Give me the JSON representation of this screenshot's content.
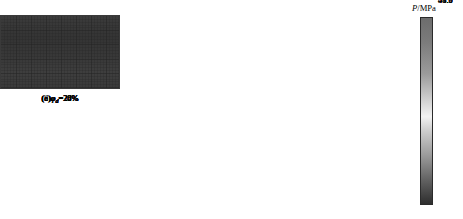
{
  "figure": {
    "type": "heatmap-panel-grid",
    "rows": 2,
    "cols": 3,
    "background": "#ffffff"
  },
  "chart_data": {
    "type": "heatmap",
    "title": "",
    "xlabel": "",
    "ylabel": "",
    "colorbar": {
      "label": "P/MPa",
      "label_symbol": "P",
      "label_unit": "/MPa",
      "ticks": [
        "54.8",
        "51.9",
        "49.0",
        "46.0",
        "43.1"
      ],
      "tick_values": [
        54.8,
        51.9,
        49.0,
        46.0,
        43.1
      ],
      "vmin": 43.1,
      "vmax": 54.8,
      "orientation": "vertical",
      "position": "right",
      "colormap": "grayscale-diverging",
      "stops": [
        {
          "pos": 0.0,
          "color": "#6d6d6d"
        },
        {
          "pos": 0.13,
          "color": "#7b7b7b"
        },
        {
          "pos": 0.3,
          "color": "#9b9b9b"
        },
        {
          "pos": 0.46,
          "color": "#d8d8d8"
        },
        {
          "pos": 0.53,
          "color": "#f2f2f2"
        },
        {
          "pos": 0.6,
          "color": "#d0d0d0"
        },
        {
          "pos": 0.74,
          "color": "#9a9a9a"
        },
        {
          "pos": 0.88,
          "color": "#5e5e5e"
        },
        {
          "pos": 1.0,
          "color": "#2e2e2e"
        }
      ]
    },
    "panels": [
      {
        "id": "a",
        "caption_prefix": "(a)",
        "symbol": "φ",
        "subscript": "d",
        "value": "20%",
        "caption": "(a)φd=20%",
        "mean_pressure": 50.2,
        "bands": [
          {
            "pos": 0.0,
            "color": "#8e8e8e"
          },
          {
            "pos": 0.3,
            "color": "#828282"
          },
          {
            "pos": 0.42,
            "color": "#6f6f6f"
          },
          {
            "pos": 0.55,
            "color": "#6a6a6a"
          },
          {
            "pos": 1.0,
            "color": "#666666"
          }
        ],
        "mesh_color": "#4b4b4b"
      },
      {
        "id": "b",
        "caption_prefix": "(b)",
        "symbol": "φ",
        "subscript": "d",
        "value": "22%",
        "caption": "(b)φd=22%",
        "mean_pressure": 53.0,
        "bands": [
          {
            "pos": 0.0,
            "color": "#d5d5d5"
          },
          {
            "pos": 0.3,
            "color": "#dedede"
          },
          {
            "pos": 0.44,
            "color": "#cfcfcf"
          },
          {
            "pos": 0.62,
            "color": "#c6c6c6"
          },
          {
            "pos": 1.0,
            "color": "#bdbdbd"
          }
        ],
        "mesh_color": "#7a7a7a"
      },
      {
        "id": "c",
        "caption_prefix": "(c)",
        "symbol": "φ",
        "subscript": "d",
        "value": "24%",
        "caption": "(c)φd=24%",
        "mean_pressure": 51.6,
        "bands": [
          {
            "pos": 0.0,
            "color": "#c3c3c3"
          },
          {
            "pos": 0.28,
            "color": "#bdbdbd"
          },
          {
            "pos": 0.4,
            "color": "#c9c9c9"
          },
          {
            "pos": 0.66,
            "color": "#d2d2d2"
          },
          {
            "pos": 1.0,
            "color": "#c8c8c8"
          }
        ],
        "mesh_color": "#6f6f6f"
      },
      {
        "id": "d",
        "caption_prefix": "(d)",
        "symbol": "φ",
        "subscript": "d",
        "value": "26%",
        "caption": "(d)φd=26%",
        "mean_pressure": 50.4,
        "bands": [
          {
            "pos": 0.0,
            "color": "#bbbbbb"
          },
          {
            "pos": 0.26,
            "color": "#b2b2b2"
          },
          {
            "pos": 0.48,
            "color": "#b8b8b8"
          },
          {
            "pos": 0.72,
            "color": "#bebebe"
          },
          {
            "pos": 1.0,
            "color": "#b4b4b4"
          }
        ],
        "mesh_color": "#636363"
      },
      {
        "id": "e",
        "caption_prefix": "(e)",
        "symbol": "φ",
        "subscript": "d",
        "value": "28%",
        "caption": "(e)φd=28%",
        "mean_pressure": 47.0,
        "bands": [
          {
            "pos": 0.0,
            "color": "#5f5f5f"
          },
          {
            "pos": 0.22,
            "color": "#585858"
          },
          {
            "pos": 0.34,
            "color": "#7d7d7d"
          },
          {
            "pos": 0.6,
            "color": "#8a8a8a"
          },
          {
            "pos": 1.0,
            "color": "#868686"
          }
        ],
        "mesh_color": "#3f3f3f"
      },
      {
        "id": "f",
        "caption_prefix": "(f)",
        "symbol": "φ",
        "subscript": "d",
        "value": "30%",
        "caption": "(f)φd=30%",
        "mean_pressure": 43.8,
        "bands": [
          {
            "pos": 0.0,
            "color": "#3b3b3b"
          },
          {
            "pos": 0.3,
            "color": "#343434"
          },
          {
            "pos": 0.55,
            "color": "#383838"
          },
          {
            "pos": 0.78,
            "color": "#3e3e3e"
          },
          {
            "pos": 1.0,
            "color": "#3a3a3a"
          }
        ],
        "mesh_color": "#242424"
      }
    ]
  }
}
